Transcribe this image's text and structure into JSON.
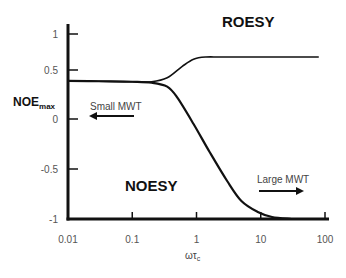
{
  "chart_data": {
    "type": "line",
    "title": "",
    "xlabel": "ωτ",
    "xlabel_sub": "c",
    "ylabel": "NOE",
    "ylabel_sub": "max",
    "xscale": "log",
    "xlim": [
      0.01,
      100
    ],
    "ylim": [
      -1,
      1
    ],
    "x_ticks": [
      0.01,
      0.1,
      1,
      10,
      100
    ],
    "x_tick_labels": [
      "0.01",
      "0.1",
      "1",
      "10",
      "100"
    ],
    "y_ticks": [
      1,
      0.5,
      0,
      -0.5,
      -1
    ],
    "y_tick_labels": [
      "1",
      "0.5",
      "0",
      "-0.5",
      "-1"
    ],
    "grid": false,
    "series": [
      {
        "name": "ROESY",
        "x": [
          0.01,
          0.03,
          0.1,
          0.2,
          0.35,
          0.6,
          0.9,
          1.4,
          2.5,
          10,
          80
        ],
        "y": [
          0.39,
          0.385,
          0.38,
          0.38,
          0.42,
          0.55,
          0.65,
          0.68,
          0.68,
          0.68,
          0.68
        ]
      },
      {
        "name": "NOESY",
        "x": [
          0.01,
          0.03,
          0.1,
          0.2,
          0.35,
          0.5,
          0.9,
          1.6,
          3,
          5,
          9,
          15,
          30
        ],
        "y": [
          0.39,
          0.385,
          0.38,
          0.37,
          0.33,
          0.22,
          -0.05,
          -0.33,
          -0.62,
          -0.82,
          -0.93,
          -0.98,
          -1.0
        ]
      }
    ],
    "annotations": [
      {
        "text": "ROESY",
        "near": "top-right",
        "style": "bold"
      },
      {
        "text": "NOESY",
        "near": "bottom-center",
        "style": "bold"
      },
      {
        "text": "Small MWT",
        "arrow": "left",
        "near": "left-middle"
      },
      {
        "text": "Large MWT",
        "arrow": "right",
        "near": "bottom-right"
      }
    ]
  }
}
